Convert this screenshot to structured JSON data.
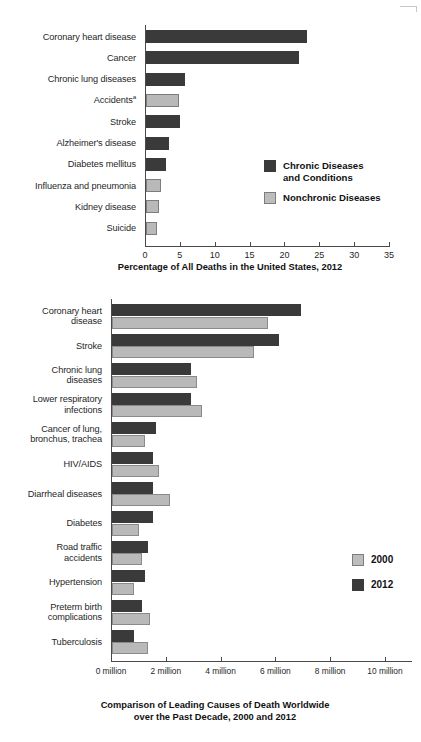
{
  "chart_data": [
    {
      "type": "bar",
      "orientation": "horizontal",
      "id": "us-deaths-2012",
      "title": "",
      "xlabel": "Percentage of All Deaths in the United States, 2012",
      "ylabel": "",
      "xlim": [
        0,
        35
      ],
      "xticks": [
        0,
        5,
        10,
        15,
        20,
        25,
        30,
        35
      ],
      "xtick_labels": [
        "0",
        "5",
        "10",
        "15",
        "20",
        "25",
        "30",
        "35"
      ],
      "grid": false,
      "legend_position": "middle-right",
      "legend": [
        {
          "label": "Chronic Diseases\nand Conditions",
          "color": "#3a3a3a",
          "key": "chronic"
        },
        {
          "label": "Nonchronic Diseases",
          "color": "#bdbdbd",
          "key": "nonchronic"
        }
      ],
      "categories": [
        "Coronary heart disease",
        "Cancer",
        "Chronic lung diseases",
        "Accidents",
        "Stroke",
        "Alzheimer's disease",
        "Diabetes mellitus",
        "Influenza and pneumonia",
        "Kidney disease",
        "Suicide"
      ],
      "category_superscripts": [
        "",
        "",
        "",
        "a",
        "",
        "",
        "",
        "",
        "",
        ""
      ],
      "values": [
        23.1,
        22.0,
        5.6,
        4.8,
        4.9,
        3.3,
        2.9,
        2.1,
        1.8,
        1.6
      ],
      "value_groups": [
        "chronic",
        "chronic",
        "chronic",
        "nonchronic",
        "chronic",
        "chronic",
        "chronic",
        "nonchronic",
        "nonchronic",
        "nonchronic"
      ]
    },
    {
      "type": "bar",
      "orientation": "horizontal",
      "id": "worldwide-deaths",
      "title": "",
      "xlabel": "Comparison of Leading Causes of Death Worldwide\nover the Past Decade, 2000 and 2012",
      "caption_line1": "Comparison of Leading Causes of Death Worldwide",
      "caption_line2": "over the Past Decade, 2000 and 2012",
      "ylabel": "",
      "xlim": [
        0,
        11
      ],
      "xticks": [
        0,
        2,
        4,
        6,
        8,
        10
      ],
      "xtick_labels": [
        "0 million",
        "2 million",
        "4 million",
        "6 million",
        "8 million",
        "10 million"
      ],
      "grid": false,
      "legend_position": "middle-right",
      "legend": [
        {
          "label": "2000",
          "color": "#bdbdbd",
          "key": "y2000"
        },
        {
          "label": "2012",
          "color": "#3a3a3a",
          "key": "y2012"
        }
      ],
      "categories": [
        "Coronary heart\ndisease",
        "Stroke",
        "Chronic lung\ndiseases",
        "Lower respiratory\ninfections",
        "Cancer of lung,\nbronchus, trachea",
        "HIV/AIDS",
        "Diarrheal diseases",
        "Diabetes",
        "Road traffic\naccidents",
        "Hypertension",
        "Preterm birth\ncomplications",
        "Tuberculosis"
      ],
      "series": [
        {
          "name": "2012",
          "key": "y2012",
          "values": [
            6.9,
            6.1,
            2.9,
            2.9,
            1.6,
            1.5,
            1.5,
            1.5,
            1.3,
            1.2,
            1.1,
            0.8
          ]
        },
        {
          "name": "2000",
          "key": "y2000",
          "values": [
            5.7,
            5.2,
            3.1,
            3.3,
            1.2,
            1.7,
            2.1,
            1.0,
            1.1,
            0.8,
            1.4,
            1.3
          ]
        }
      ],
      "unit": "million"
    }
  ]
}
